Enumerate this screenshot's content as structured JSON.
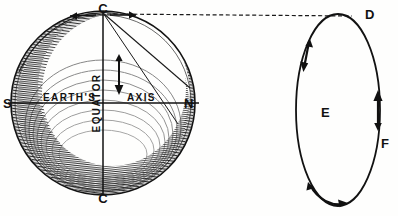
{
  "figure": {
    "style": "antique line engraving",
    "background_color": "#fefefd",
    "ink_color": "#111111",
    "shade_color": "#3a3a3a"
  },
  "earth": {
    "center_x": 103,
    "center_y": 103,
    "radius": 92,
    "labels": {
      "pole_top": "C",
      "pole_bottom": "C",
      "south": "S",
      "north": "N",
      "axis_left": "EARTH'S",
      "axis_right": "AXIS",
      "equator": "EQUATOR"
    },
    "arrows": {
      "axis_down": "down-arrow",
      "limb_left": "left-arrow",
      "limb_right": "right-arrow"
    }
  },
  "orbit": {
    "center_x": 338,
    "center_y": 110,
    "radius_x": 42,
    "radius_y": 96,
    "labels": {
      "top": "D",
      "left": "E",
      "right": "F"
    },
    "arrows": {
      "upper_left": "down-arrow",
      "right": "up-arrow",
      "bottom": "right-arrow"
    }
  },
  "connector": {
    "type": "dashed-line",
    "from": "C",
    "to": "D"
  }
}
